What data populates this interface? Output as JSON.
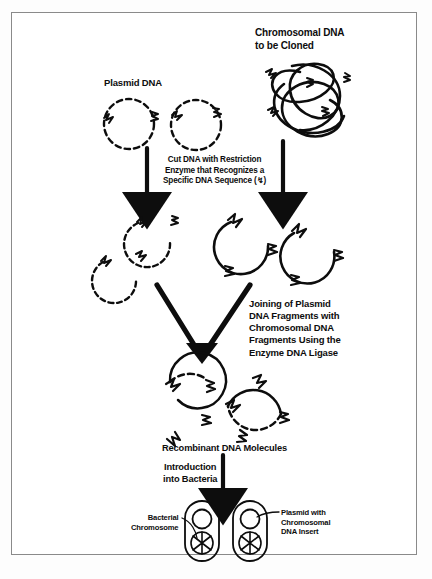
{
  "figure": {
    "domain_title": "Recombinant DNA Cloning Schematic",
    "border_color": "#8a8a8a",
    "ink_color": "#0d0d0d",
    "background_color": "#ffffff"
  },
  "labels": {
    "plasmid_dna": "Plasmid DNA",
    "chromosomal_dna": "Chromosomal DNA\nto be Cloned",
    "cut_step": "Cut DNA with Restriction\nEnzyme that Recognizes a\nSpecific DNA Sequence (↯)",
    "joining_step": "Joining of Plasmid\nDNA Fragments with\nChromosomal DNA\nFragments Using the\nEnzyme DNA Ligase",
    "recombinant": "Recombinant DNA Molecules",
    "introduction": "Introduction\ninto Bacteria",
    "bacterial_chromosome": "Bacterial\nChromosome",
    "plasmid_with_insert": "Plasmid with\nChromosomal\nDNA Insert"
  },
  "diagram_data": {
    "type": "diagram",
    "steps": [
      "Plasmid DNA and Chromosomal DNA to be Cloned",
      "Cut DNA with Restriction Enzyme that Recognizes a Specific DNA Sequence",
      "Joining of Plasmid DNA Fragments with Chromosomal DNA Fragments Using the Enzyme DNA Ligase",
      "Recombinant DNA Molecules",
      "Introduction into Bacteria"
    ],
    "elements": {
      "plasmid_circles_count": 2,
      "plasmid_line_style": "dashed",
      "chromosomal_line_style": "solid",
      "plasmid_fragments_count": 3,
      "chromosomal_fragments_count": 3,
      "recombinant_molecules_count": 2,
      "bacteria_count": 2,
      "restriction_site_marker": "zigzag"
    }
  }
}
